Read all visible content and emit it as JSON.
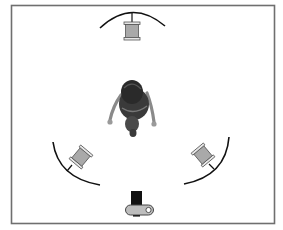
{
  "diagram": {
    "frame": {
      "x": 11,
      "y": 5,
      "width": 264,
      "height": 219,
      "stroke": "#6f6f6f"
    },
    "colors": {
      "light_fill": "#a9a9a9",
      "light_stroke": "#555555",
      "arc": "#111111",
      "camera_lens": "#111111",
      "camera_body": "#bdbdbd"
    },
    "elements": [
      {
        "id": "light-top",
        "label": "Back light",
        "type": "light"
      },
      {
        "id": "light-left",
        "label": "Key light",
        "type": "light"
      },
      {
        "id": "light-right",
        "label": "Fill light",
        "type": "light"
      },
      {
        "id": "subject",
        "label": "Subject",
        "type": "person"
      },
      {
        "id": "camera",
        "label": "Camera",
        "type": "camera"
      }
    ]
  }
}
